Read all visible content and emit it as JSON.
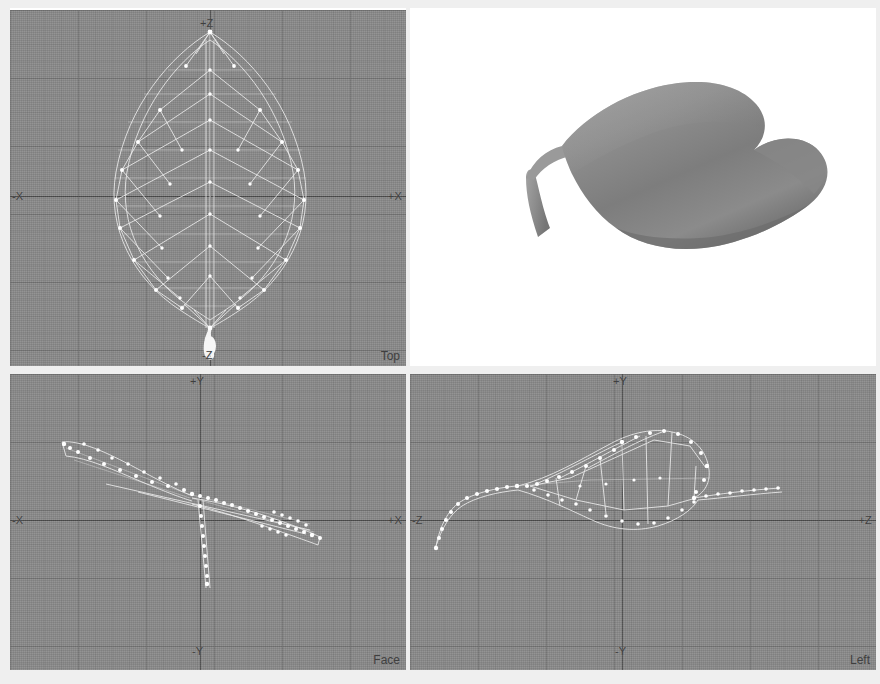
{
  "app": {
    "title": "3D Modeling Viewport Layout",
    "background_color": "#ffffff",
    "viewport_background": "#8a8a8a",
    "wireframe_color": "#efefef",
    "axis_color": "#4c4c4c",
    "grid_color": "#6e6e6e"
  },
  "viewports": [
    {
      "id": "top",
      "name": "Top",
      "shading": "wireframe",
      "background": "#8a8a8a",
      "axis_labels": {
        "top": "+Z",
        "bottom": "-Z",
        "left": "-X",
        "right": "+X"
      }
    },
    {
      "id": "perspective",
      "name": "",
      "shading": "smooth",
      "background": "#ffffff",
      "axis_labels": {
        "top": "",
        "bottom": "",
        "left": "",
        "right": ""
      }
    },
    {
      "id": "face",
      "name": "Face",
      "shading": "wireframe",
      "background": "#8a8a8a",
      "axis_labels": {
        "top": "+Y",
        "bottom": "-Y",
        "left": "-X",
        "right": "+X"
      }
    },
    {
      "id": "left",
      "name": "Left",
      "shading": "wireframe",
      "background": "#8a8a8a",
      "axis_labels": {
        "top": "+Y",
        "bottom": "-Y",
        "left": "-Z",
        "right": "+Z"
      }
    }
  ],
  "model": {
    "subject": "leaf",
    "description": "Low-polygon leaf mesh with stem, shown in four orthographic/perspective views"
  }
}
